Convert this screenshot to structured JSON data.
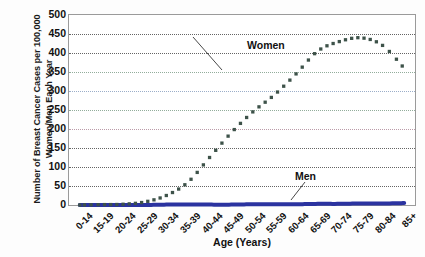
{
  "chart_data": {
    "type": "line",
    "title": "",
    "xlabel": "Age (Years)",
    "ylabel": "Number of Breast Cancer Cases per 100,000 Women/Men Each Year",
    "ylabel_line1": "Number of Breast Cancer Cases per 100,000",
    "ylabel_line2": "Women/Men Each Year",
    "categories": [
      "0-14",
      "15-19",
      "20-24",
      "25-29",
      "30-34",
      "35-39",
      "40-44",
      "45-49",
      "50-54",
      "55-59",
      "60-64",
      "65-69",
      "70-74",
      "75-79",
      "80-84",
      "85+"
    ],
    "series": [
      {
        "name": "Women",
        "values": [
          0,
          1,
          2,
          8,
          25,
          60,
          125,
          190,
          245,
          290,
          345,
          405,
          430,
          440,
          420,
          360
        ],
        "color": "#3d5249",
        "marker": "square",
        "annotation": "Women"
      },
      {
        "name": "Men",
        "values": [
          0,
          0,
          0,
          0,
          1,
          1,
          1,
          1,
          2,
          2,
          2,
          3,
          3,
          4,
          4,
          5
        ],
        "color": "#2b33a0",
        "marker": "none",
        "annotation": "Men"
      }
    ],
    "ylim": [
      0,
      500
    ],
    "ytick_values": [
      0,
      50,
      100,
      150,
      200,
      250,
      300,
      350,
      400,
      450,
      500
    ],
    "ytick_labels": [
      "0",
      "50",
      "100",
      "150",
      "200",
      "250",
      "300",
      "350",
      "400",
      "450",
      "500"
    ],
    "grid": true,
    "grid_style": "dotted",
    "legend": "annotated-inline",
    "legend_position": "inline",
    "plot_border_color": "#9a9a9a",
    "background_color": "#ffffff"
  }
}
